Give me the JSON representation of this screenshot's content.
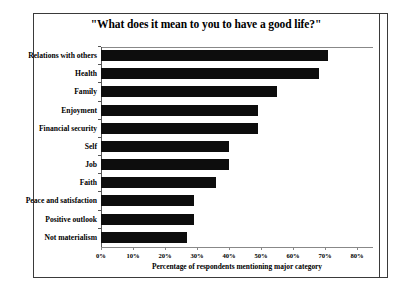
{
  "chart_data": {
    "type": "bar",
    "orientation": "horizontal",
    "title": "\"What does it mean to you to have a good life?\"",
    "xlabel": "Percentage of respondents mentioning major category",
    "ylabel": "",
    "categories": [
      "Relations with others",
      "Health",
      "Family",
      "Enjoyment",
      "Financial security",
      "Self",
      "Job",
      "Faith",
      "Peace and satisfaction",
      "Positive outlook",
      "Not materialism"
    ],
    "values": [
      71,
      68,
      55,
      49,
      49,
      40,
      40,
      36,
      29,
      29,
      27
    ],
    "xlim": [
      0,
      80
    ],
    "xticks": [
      0,
      10,
      20,
      30,
      40,
      50,
      60,
      70,
      80
    ],
    "xtick_labels": [
      "0%",
      "10%",
      "20%",
      "30%",
      "40%",
      "50%",
      "60%",
      "70%",
      "80%"
    ],
    "grid": false,
    "legend": null,
    "bar_color": "#0d0d0d",
    "axis_color": "#888888",
    "background": "#ffffff"
  }
}
